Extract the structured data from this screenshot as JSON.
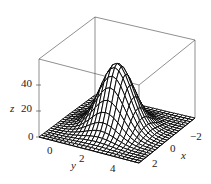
{
  "chart_data": {
    "type": "surface3d",
    "title": "",
    "xlabel": "x",
    "ylabel": "y",
    "zlabel": "z",
    "x_ticks": [
      -2,
      0,
      2
    ],
    "y_ticks": [
      0,
      2,
      4
    ],
    "z_ticks": [
      0,
      20,
      40
    ],
    "xlim": [
      -3,
      3
    ],
    "ylim": [
      -1,
      5
    ],
    "zlim": [
      0,
      60
    ],
    "surface": {
      "function": "gaussian bump",
      "peak_z": 50,
      "peak_x": 0,
      "peak_y": 2,
      "sigma": 0.9
    },
    "grid": false,
    "legend": null,
    "style": {
      "mesh_color": "#000000",
      "face_color": "#ffffff",
      "box_color": "#444444"
    }
  },
  "labels": {
    "z_axis": "z",
    "z_tick_0": "0",
    "z_tick_20": "20",
    "z_tick_40": "40",
    "y_axis": "y",
    "y_tick_0": "0",
    "y_tick_2": "2",
    "y_tick_4": "4",
    "x_axis": "x",
    "x_tick_m2": "−2",
    "x_tick_0": "0",
    "x_tick_2": "2"
  }
}
